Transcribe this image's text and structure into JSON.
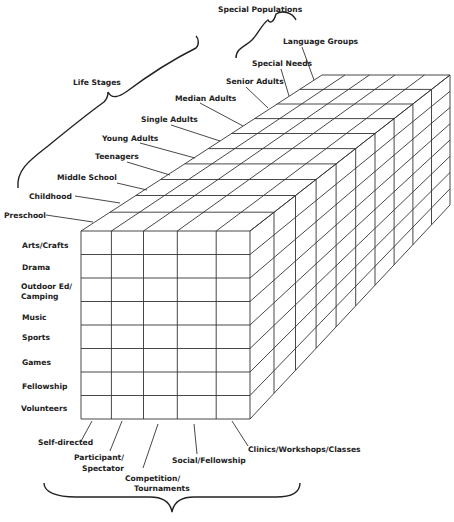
{
  "diagram": {
    "type": "3d-matrix-cube",
    "groups": {
      "special_populations": "Special Populations",
      "life_stages": "Life Stages"
    },
    "depth_axis": [
      {
        "label": "Preschool",
        "group": "life_stages"
      },
      {
        "label": "Childhood",
        "group": "life_stages"
      },
      {
        "label": "Middle School",
        "group": "life_stages"
      },
      {
        "label": "Teenagers",
        "group": "life_stages"
      },
      {
        "label": "Young Adults",
        "group": "life_stages"
      },
      {
        "label": "Single Adults",
        "group": "life_stages"
      },
      {
        "label": "Median Adults",
        "group": "life_stages"
      },
      {
        "label": "Senior Adults",
        "group": "life_stages"
      },
      {
        "label": "Special Needs",
        "group": "special_populations"
      },
      {
        "label": "Language Groups",
        "group": "special_populations"
      }
    ],
    "row_axis": [
      {
        "label": "Arts/Crafts"
      },
      {
        "label": "Drama"
      },
      {
        "label": "Outdoor Ed/",
        "label2": "Camping"
      },
      {
        "label": "Music"
      },
      {
        "label": "Sports"
      },
      {
        "label": "Games"
      },
      {
        "label": "Fellowship"
      },
      {
        "label": "Volunteers"
      }
    ],
    "column_axis": [
      {
        "label": "Self-directed"
      },
      {
        "label": "Participant/",
        "label2": "Spectator"
      },
      {
        "label": "Competition/",
        "label2": "Tournaments"
      },
      {
        "label": "Social/Fellowship"
      },
      {
        "label": "Clinics/Workshops/Classes"
      }
    ],
    "colors": {
      "line": "#333333",
      "text": "#222222",
      "background": "#ffffff"
    }
  }
}
